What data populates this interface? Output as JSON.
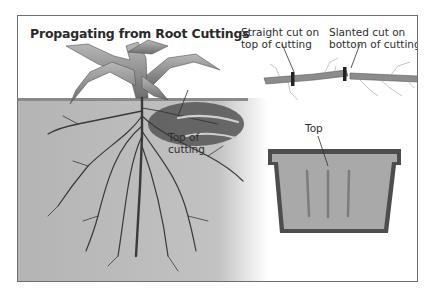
{
  "title": "Propagating from Root Cuttings",
  "labels": {
    "top_of_cutting_line1": "Top of",
    "top_of_cutting_line2": "cutting",
    "straight_cut_line1": "Straight cut on",
    "straight_cut_line2": "top of cutting",
    "slanted_cut_line1": "Slanted cut on",
    "slanted_cut_line2": "bottom of cutting",
    "pot_top": "Top"
  },
  "colors": {
    "frame_border": "#6e6e6e",
    "soil": "#b9b9b9",
    "dark_soil": "#4a4a4a",
    "roots": "#3a3a3a",
    "leaves": "#8f8f8f",
    "pot": "#4d4d4d",
    "pot_fill": "#a9a9a9"
  }
}
